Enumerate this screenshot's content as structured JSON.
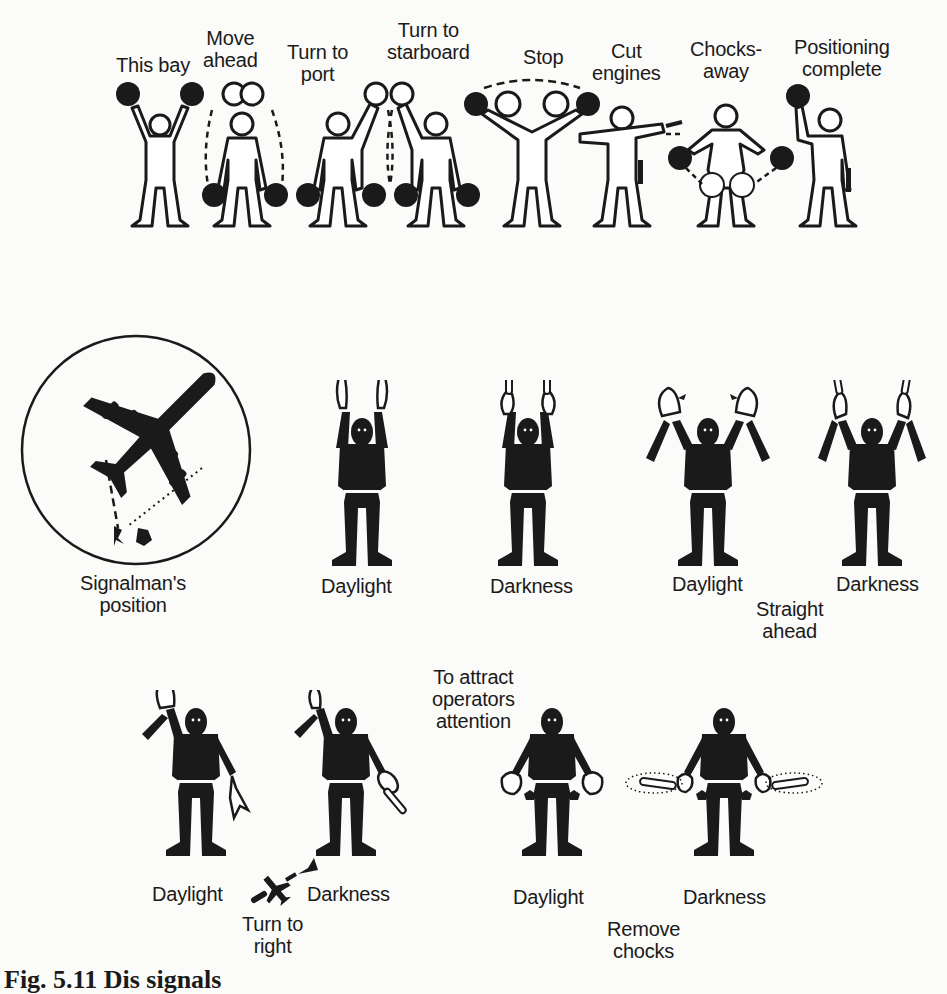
{
  "row1": {
    "signals": [
      {
        "label_lines": [
          "This bay"
        ]
      },
      {
        "label_lines": [
          "Move",
          "ahead"
        ]
      },
      {
        "label_lines": [
          "Turn to",
          "port"
        ]
      },
      {
        "label_lines": [
          "Turn to",
          "starboard"
        ]
      },
      {
        "label_lines": [
          "Stop"
        ]
      },
      {
        "label_lines": [
          "Cut",
          "engines"
        ]
      },
      {
        "label_lines": [
          "Chocks-",
          "away"
        ]
      },
      {
        "label_lines": [
          "Positioning",
          "complete"
        ]
      }
    ]
  },
  "row2": {
    "signalman": {
      "label_lines": [
        "Signalman's",
        "position"
      ]
    },
    "figures": [
      {
        "label": "Daylight"
      },
      {
        "label": "Darkness"
      },
      {
        "label": "Daylight"
      },
      {
        "label": "Darkness"
      }
    ],
    "group_label_lines": [
      "Straight",
      "ahead"
    ]
  },
  "row3": {
    "attract_label_lines": [
      "To attract",
      "operators",
      "attention"
    ],
    "turn_right": {
      "figures": [
        {
          "label": "Daylight"
        },
        {
          "label": "Darkness"
        }
      ],
      "group_label_lines": [
        "Turn to",
        "right"
      ]
    },
    "remove_chocks": {
      "figures": [
        {
          "label": "Daylight"
        },
        {
          "label": "Darkness"
        }
      ],
      "group_label_lines": [
        "Remove",
        "chocks"
      ]
    }
  },
  "caption": "Fig. 5.11 Dis   signals",
  "colors": {
    "ink": "#1a1a1a",
    "paper": "#fbfbf9"
  }
}
